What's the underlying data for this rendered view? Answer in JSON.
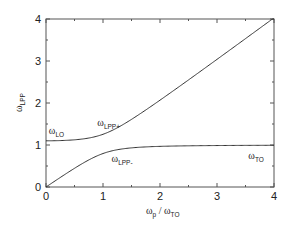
{
  "chart_data": {
    "type": "line",
    "title": "",
    "xlabel": {
      "main": "ω",
      "sub": "p",
      "sep": " / ",
      "main2": "ω",
      "sub2": "TO"
    },
    "ylabel": {
      "main": "ω",
      "sub": "LPP"
    },
    "xlim": [
      0,
      4
    ],
    "ylim": [
      0,
      4
    ],
    "x_ticks": [
      0,
      1,
      2,
      3,
      4
    ],
    "y_ticks": [
      0,
      1,
      2,
      3,
      4
    ],
    "x_tick_labels": [
      "0",
      "1",
      "2",
      "3",
      "4"
    ],
    "y_tick_labels": [
      "0",
      "1",
      "2",
      "3",
      "4"
    ],
    "grid": false,
    "legend": "none",
    "parameters": {
      "omega_TO": 1.0,
      "omega_LO": 1.1
    },
    "series": [
      {
        "name": "ω_LPP+",
        "x": [
          0,
          0.25,
          0.5,
          0.75,
          1.0,
          1.25,
          1.5,
          1.75,
          2.0,
          2.5,
          3.0,
          3.5,
          4.0
        ],
        "y": [
          1.1,
          1.12,
          1.17,
          1.27,
          1.42,
          1.61,
          1.82,
          2.04,
          2.27,
          2.73,
          3.19,
          3.67,
          4.14
        ]
      },
      {
        "name": "ω_LPP-",
        "x": [
          0,
          0.25,
          0.5,
          0.75,
          1.0,
          1.25,
          1.5,
          1.75,
          2.0,
          2.5,
          3.0,
          3.5,
          4.0
        ],
        "y": [
          0,
          0.22,
          0.43,
          0.6,
          0.74,
          0.83,
          0.88,
          0.91,
          0.94,
          0.96,
          0.97,
          0.98,
          0.99
        ]
      }
    ],
    "annotations": [
      {
        "id": "lo",
        "main": "ω",
        "sub": "LO",
        "x": 0.05,
        "y": 1.27
      },
      {
        "id": "lpp-plus",
        "main": "ω",
        "sub": "LPP+",
        "x": 0.9,
        "y": 1.45
      },
      {
        "id": "lpp-minus",
        "main": "ω",
        "sub": "LPP-",
        "x": 1.15,
        "y": 0.6
      },
      {
        "id": "to",
        "main": "ω",
        "sub": "TO",
        "x": 3.55,
        "y": 0.66
      }
    ]
  }
}
